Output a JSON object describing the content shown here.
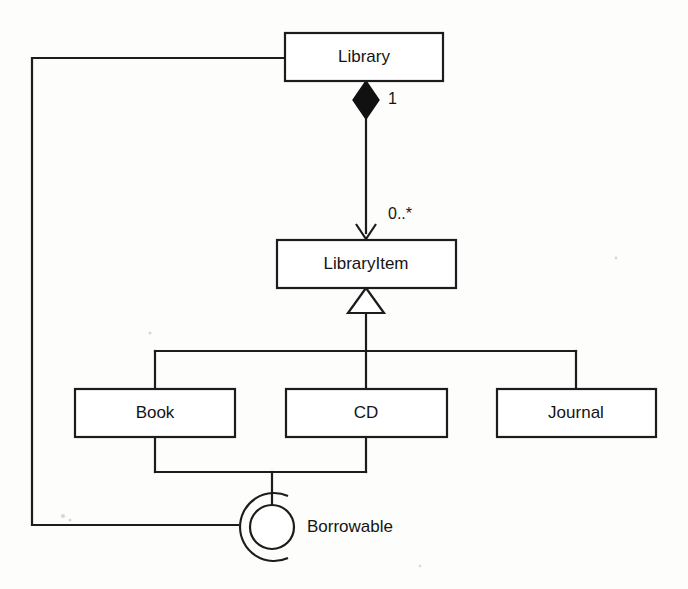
{
  "diagram": {
    "kind": "uml-class-diagram",
    "background_color": "#fdfdfc",
    "line_color": "#1c1c1c",
    "box_fill": "#ffffff",
    "classes": [
      {
        "id": "library",
        "name": "Library",
        "x": 285,
        "y": 33,
        "w": 158,
        "h": 48
      },
      {
        "id": "libraryitem",
        "name": "LibraryItem",
        "x": 277,
        "y": 240,
        "w": 179,
        "h": 48
      },
      {
        "id": "book",
        "name": "Book",
        "x": 75,
        "y": 389,
        "w": 160,
        "h": 48
      },
      {
        "id": "cd",
        "name": "CD",
        "x": 286,
        "y": 389,
        "w": 161,
        "h": 48
      },
      {
        "id": "journal",
        "name": "Journal",
        "x": 497,
        "y": 389,
        "w": 159,
        "h": 48
      }
    ],
    "interface": {
      "id": "borrowable",
      "name": "Borrowable",
      "notation": "ball-and-socket",
      "ball_cx": 272,
      "ball_cy": 527,
      "ball_r": 22,
      "socket_r": 34,
      "label_x": 307,
      "label_y": 528
    },
    "relationships": [
      {
        "id": "library-composition-libraryitem",
        "type": "composition",
        "from": "library",
        "to": "libraryitem",
        "source_multiplicity": "1",
        "target_multiplicity": "0..*",
        "source_multiplicity_x": 388,
        "source_multiplicity_y": 100,
        "target_multiplicity_x": 388,
        "target_multiplicity_y": 215
      },
      {
        "id": "subclasses-generalization-libraryitem",
        "type": "generalization",
        "from": [
          "book",
          "cd",
          "journal"
        ],
        "to": "libraryitem"
      },
      {
        "id": "book-cd-provide-borrowable",
        "type": "provided-interface",
        "from": [
          "book",
          "cd"
        ],
        "to": "borrowable"
      },
      {
        "id": "library-requires-borrowable",
        "type": "required-interface",
        "from": "library",
        "to": "borrowable"
      }
    ],
    "labels": {
      "multiplicity_one": "1",
      "multiplicity_many": "0..*"
    }
  }
}
